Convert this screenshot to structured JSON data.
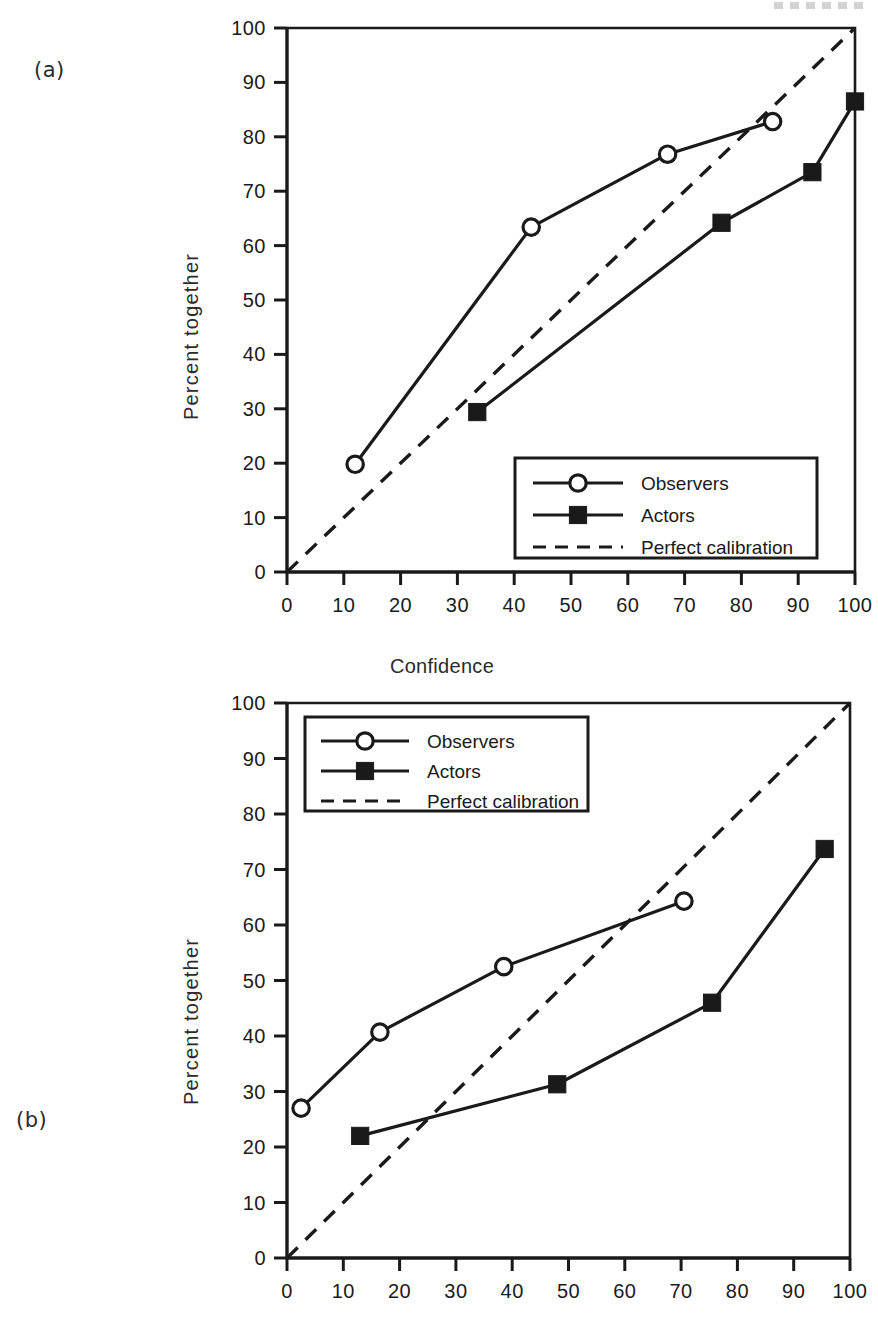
{
  "figure": {
    "panels": [
      {
        "id": "a",
        "label": "(a)"
      },
      {
        "id": "b",
        "label": "(b)"
      }
    ],
    "shared_x_axis_title": "Confidence",
    "y_axis_title": "Percent together"
  },
  "chart_data": [
    {
      "panel": "a",
      "type": "line",
      "title": "",
      "xlabel": "Confidence",
      "ylabel": "Percent together",
      "xlim": [
        0,
        100
      ],
      "ylim": [
        0,
        100
      ],
      "xticks": [
        0,
        10,
        20,
        30,
        40,
        50,
        60,
        70,
        80,
        90,
        100
      ],
      "yticks": [
        0,
        10,
        20,
        30,
        40,
        50,
        60,
        70,
        80,
        90,
        100
      ],
      "xtick_labels": [
        "0",
        "10",
        "20",
        "30",
        "40",
        "50",
        "60",
        "70",
        "80",
        "90",
        "100"
      ],
      "ytick_labels": [
        "0",
        "10",
        "20",
        "30",
        "40",
        "50",
        "60",
        "70",
        "80",
        "90",
        "100"
      ],
      "grid": false,
      "legend_position": "lower right",
      "series": [
        {
          "name": "Observers",
          "marker": "open-circle",
          "linestyle": "solid",
          "points": [
            [
              12,
              19.8
            ],
            [
              43,
              63.4
            ],
            [
              67,
              76.8
            ],
            [
              85.5,
              82.8
            ]
          ]
        },
        {
          "name": "Actors",
          "marker": "filled-square",
          "linestyle": "solid",
          "points": [
            [
              33.5,
              29.4
            ],
            [
              76.5,
              64.2
            ],
            [
              92.5,
              73.5
            ],
            [
              100,
              86.5
            ]
          ]
        },
        {
          "name": "Perfect calibration",
          "marker": "none",
          "linestyle": "dashed",
          "points": [
            [
              0,
              0
            ],
            [
              100,
              100
            ]
          ]
        }
      ]
    },
    {
      "panel": "b",
      "type": "line",
      "title": "",
      "xlabel": "Confidence",
      "ylabel": "Percent together",
      "xlim": [
        0,
        100
      ],
      "ylim": [
        0,
        100
      ],
      "xticks": [
        0,
        10,
        20,
        30,
        40,
        50,
        60,
        70,
        80,
        90,
        100
      ],
      "yticks": [
        0,
        10,
        20,
        30,
        40,
        50,
        60,
        70,
        80,
        90,
        100
      ],
      "xtick_labels": [
        "0",
        "10",
        "20",
        "30",
        "40",
        "50",
        "60",
        "70",
        "80",
        "90",
        "100"
      ],
      "ytick_labels": [
        "0",
        "10",
        "20",
        "30",
        "40",
        "50",
        "60",
        "70",
        "80",
        "90",
        "100"
      ],
      "grid": false,
      "legend_position": "upper left",
      "series": [
        {
          "name": "Observers",
          "marker": "open-circle",
          "linestyle": "solid",
          "points": [
            [
              2.5,
              27.0
            ],
            [
              16.5,
              40.7
            ],
            [
              38.5,
              52.5
            ],
            [
              70.5,
              64.3
            ]
          ]
        },
        {
          "name": "Actors",
          "marker": "filled-square",
          "linestyle": "solid",
          "points": [
            [
              13.0,
              22.0
            ],
            [
              48.0,
              31.3
            ],
            [
              75.5,
              46.0
            ],
            [
              95.5,
              73.7
            ]
          ]
        },
        {
          "name": "Perfect calibration",
          "marker": "none",
          "linestyle": "dashed",
          "points": [
            [
              0,
              0
            ],
            [
              100,
              100
            ]
          ]
        }
      ]
    }
  ],
  "legend": {
    "entries": [
      {
        "label": "Observers",
        "marker": "open-circle",
        "linestyle": "solid"
      },
      {
        "label": "Actors",
        "marker": "filled-square",
        "linestyle": "solid"
      },
      {
        "label": "Perfect calibration",
        "marker": "none",
        "linestyle": "dashed"
      }
    ]
  },
  "colors": {
    "ink": "#1a1a1a",
    "background": "#ffffff"
  }
}
